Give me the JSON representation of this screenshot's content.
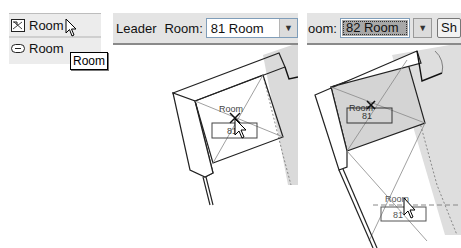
{
  "left_panel": {
    "items": [
      {
        "label": "Room",
        "icon": "room-icon"
      },
      {
        "label": "Room",
        "icon": "room-tag-icon"
      }
    ],
    "tooltip": "Room"
  },
  "middle_panel": {
    "toolbar": {
      "leader_label": "Leader",
      "room_label": "Room:",
      "room_value": "81  Room"
    },
    "plan": {
      "room_tag_name": "Room",
      "room_tag_number": "81"
    }
  },
  "right_panel": {
    "toolbar": {
      "room_label": "oom:",
      "room_value": "82  Room",
      "button_label": "Sh"
    },
    "plan": {
      "placed_tag_name": "Room",
      "placed_tag_number": "81",
      "moving_tag_name": "Room",
      "moving_tag_number": "81"
    }
  },
  "colors": {
    "toolbar_bg": "#e4e4e4",
    "selected_room_fill": "#d4d4d4",
    "combo_selected": "#a8a8a8"
  }
}
